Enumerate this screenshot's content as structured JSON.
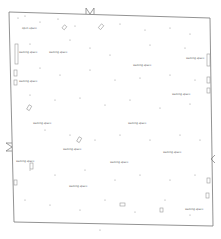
{
  "diagram": {
    "type": "floor-plan",
    "outline_color": "#777777",
    "mark_color": "#888888",
    "labels": [
      {
        "text": "open space",
        "x": 22,
        "y": 27
      },
      {
        "text": "walking space",
        "x": 19,
        "y": 51
      },
      {
        "text": "walking space",
        "x": 49,
        "y": 51
      },
      {
        "text": "walking space",
        "x": 19,
        "y": 80
      },
      {
        "text": "walking space",
        "x": 133,
        "y": 64
      },
      {
        "text": "walking space",
        "x": 186,
        "y": 57
      },
      {
        "text": "walking space",
        "x": 172,
        "y": 93
      },
      {
        "text": "walking space",
        "x": 33,
        "y": 122
      },
      {
        "text": "walking space",
        "x": 128,
        "y": 122
      },
      {
        "text": "walking space",
        "x": 63,
        "y": 148
      },
      {
        "text": "walking space",
        "x": 163,
        "y": 151
      },
      {
        "text": "walking space",
        "x": 110,
        "y": 161
      },
      {
        "text": "walking space",
        "x": 16,
        "y": 160
      },
      {
        "text": "walking space",
        "x": 69,
        "y": 185
      },
      {
        "text": "walking space",
        "x": 185,
        "y": 208
      }
    ]
  }
}
